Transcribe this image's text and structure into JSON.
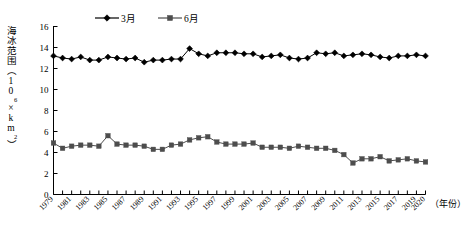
{
  "chart_data": {
    "type": "line",
    "title": "",
    "xlabel": "（年份）",
    "ylabel": "海冰范围（10⁶×km²）",
    "ylim": [
      0,
      16
    ],
    "ytick_step": 2,
    "yticks": [
      0,
      2,
      4,
      6,
      8,
      10,
      12,
      14,
      16
    ],
    "xlim": [
      1979,
      2020
    ],
    "grid": false,
    "legend_position": "top-center",
    "x": [
      1979,
      1980,
      1981,
      1982,
      1983,
      1984,
      1985,
      1986,
      1987,
      1988,
      1989,
      1990,
      1991,
      1992,
      1993,
      1994,
      1995,
      1996,
      1997,
      1998,
      1999,
      2000,
      2001,
      2002,
      2003,
      2004,
      2005,
      2006,
      2007,
      2008,
      2009,
      2010,
      2011,
      2012,
      2013,
      2014,
      2015,
      2016,
      2017,
      2018,
      2019,
      2020
    ],
    "xtick_labels": [
      "1979",
      "1981",
      "1983",
      "1985",
      "1987",
      "1989",
      "1991",
      "1993",
      "1995",
      "1997",
      "1999",
      "2001",
      "2003",
      "2005",
      "2007",
      "2009",
      "2011",
      "2013",
      "2015",
      "2017",
      "2019",
      "2020"
    ],
    "series": [
      {
        "name": "3月",
        "marker": "diamond",
        "color": "#000000",
        "values": [
          13.2,
          13.0,
          12.9,
          13.1,
          12.8,
          12.8,
          13.1,
          13.0,
          12.9,
          13.0,
          12.6,
          12.8,
          12.8,
          12.9,
          12.9,
          13.9,
          13.4,
          13.2,
          13.5,
          13.5,
          13.5,
          13.4,
          13.4,
          13.1,
          13.2,
          13.3,
          13.0,
          12.9,
          13.0,
          13.5,
          13.4,
          13.5,
          13.2,
          13.3,
          13.4,
          13.3,
          13.1,
          13.0,
          13.2,
          13.2,
          13.3,
          13.2
        ]
      },
      {
        "name": "6月",
        "marker": "square",
        "color": "#4d4d4d",
        "values": [
          4.9,
          4.4,
          4.6,
          4.7,
          4.7,
          4.6,
          5.6,
          4.8,
          4.7,
          4.7,
          4.6,
          4.3,
          4.3,
          4.7,
          4.8,
          5.2,
          5.4,
          5.5,
          5.0,
          4.8,
          4.8,
          4.8,
          4.9,
          4.5,
          4.5,
          4.5,
          4.4,
          4.6,
          4.5,
          4.4,
          4.4,
          4.2,
          3.8,
          3.0,
          3.4,
          3.4,
          3.6,
          3.2,
          3.3,
          3.4,
          3.2,
          3.1
        ]
      }
    ]
  },
  "legend": {
    "items": [
      {
        "label": "3月",
        "marker": "diamond",
        "color": "#000000"
      },
      {
        "label": "6月",
        "marker": "square",
        "color": "#4d4d4d"
      }
    ]
  },
  "axes": {
    "y_title_main": "海冰范围",
    "y_title_paren_open": "（",
    "y_title_base": "10",
    "y_title_exp": "6",
    "y_title_mult": "×km",
    "y_title_exp2": "2",
    "y_title_paren_close": "）",
    "x_title": "（年份）"
  }
}
